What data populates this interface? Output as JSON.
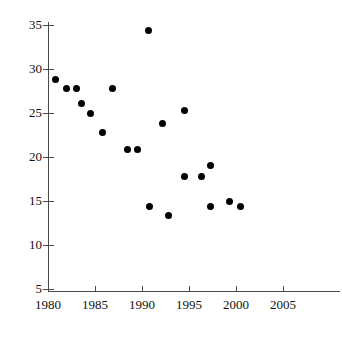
{
  "chart_data": {
    "type": "scatter",
    "title": "",
    "xlabel": "",
    "ylabel": "",
    "xlim": [
      1980,
      2006.5
    ],
    "ylim": [
      5,
      35.6
    ],
    "grid": false,
    "legend": "none",
    "marker": {
      "shape": "circle",
      "color": "#000000",
      "size_px": 7
    },
    "x_ticks": [
      1980,
      1985,
      1990,
      1995,
      2000,
      2005
    ],
    "x_tick_labels": [
      "1980",
      "1985",
      "1990",
      "1995",
      "2000",
      "2005"
    ],
    "y_ticks": [
      5,
      10,
      15,
      20,
      25,
      30,
      35
    ],
    "y_tick_labels": [
      "5",
      "10",
      "15",
      "20",
      "25",
      "30",
      "35"
    ],
    "points": [
      {
        "x": 1980.8,
        "y": 28.8
      },
      {
        "x": 1982.0,
        "y": 27.8
      },
      {
        "x": 1983.0,
        "y": 27.8
      },
      {
        "x": 1983.6,
        "y": 26.1
      },
      {
        "x": 1984.5,
        "y": 25.0
      },
      {
        "x": 1985.8,
        "y": 22.8
      },
      {
        "x": 1986.9,
        "y": 27.8
      },
      {
        "x": 1988.5,
        "y": 20.9
      },
      {
        "x": 1989.5,
        "y": 20.9
      },
      {
        "x": 1990.7,
        "y": 34.4
      },
      {
        "x": 1990.8,
        "y": 14.4
      },
      {
        "x": 1992.2,
        "y": 23.8
      },
      {
        "x": 1992.8,
        "y": 13.4
      },
      {
        "x": 1994.5,
        "y": 25.3
      },
      {
        "x": 1994.5,
        "y": 17.8
      },
      {
        "x": 1996.3,
        "y": 17.8
      },
      {
        "x": 1997.3,
        "y": 19.0
      },
      {
        "x": 1997.3,
        "y": 14.4
      },
      {
        "x": 1999.3,
        "y": 15.0
      },
      {
        "x": 2000.5,
        "y": 14.4
      }
    ]
  },
  "axes": {
    "y_labels": [
      "35",
      "30",
      "25",
      "20",
      "15",
      "10",
      "5"
    ],
    "x_labels": [
      "1980",
      "1985",
      "1990",
      "1995",
      "2000",
      "2005"
    ]
  }
}
